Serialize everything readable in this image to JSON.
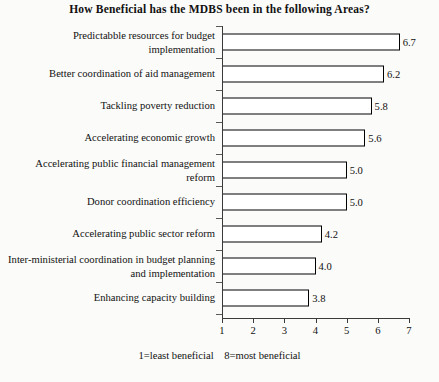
{
  "chart_data": {
    "type": "bar",
    "orientation": "horizontal",
    "title": "How Beneficial has the MDBS been in the following Areas?",
    "xlabel": "",
    "ylabel": "",
    "xlim": [
      1,
      7
    ],
    "xticks": [
      "1",
      "2",
      "3",
      "4",
      "5",
      "6",
      "7"
    ],
    "grid": false,
    "legend": false,
    "bar_color": "#ffffff",
    "bar_edge_color": "#000000",
    "axis_color": "#3a3a3a",
    "categories": [
      "Predictabble resources for budget implementation",
      "Better coordination of aid management",
      "Tackling poverty reduction",
      "Accelerating economic growth",
      "Accelerating public financial management reform",
      "Donor coordination efficiency",
      "Accelerating public sector reform",
      "Inter-ministerial coordination in budget planning and implementation",
      "Enhancing capacity building"
    ],
    "values": [
      6.7,
      6.2,
      5.8,
      5.6,
      5.0,
      5.0,
      4.2,
      4.0,
      3.8
    ],
    "data_labels": [
      "6.7",
      "6.2",
      "5.8",
      "5.6",
      "5.0",
      "5.0",
      "4.2",
      "4.0",
      "3.8"
    ],
    "annotation_left": "1=least beneficial",
    "annotation_right": "8=most beneficial"
  }
}
